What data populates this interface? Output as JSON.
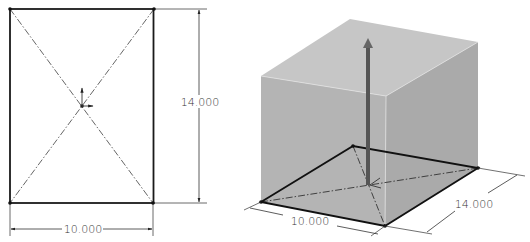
{
  "sketch_2d": {
    "width_dimension": "10.000",
    "height_dimension": "14.000",
    "width_value": 10.0,
    "height_value": 14.0
  },
  "extrusion_3d": {
    "width_dimension": "10.000",
    "depth_dimension": "14.000"
  },
  "colors": {
    "line": "#1a1a1a",
    "construction_line": "#555555",
    "top_face": "#c4c4c4",
    "front_face": "#b2b2b2",
    "side_face": "#a9a9a9",
    "arrow": "#555555",
    "background": "#ffffff"
  }
}
